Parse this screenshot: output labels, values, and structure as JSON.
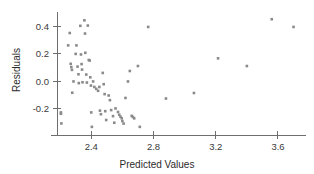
{
  "chart_data": {
    "type": "scatter",
    "title": "",
    "xlabel": "Predicted Values",
    "ylabel": "Residuals",
    "xlim": [
      2.18,
      3.78
    ],
    "ylim": [
      -0.36,
      0.49
    ],
    "xticks": [
      2.4,
      2.8,
      3.2,
      3.6
    ],
    "xticklabels": [
      "2.4",
      "2.8",
      "3.2",
      "3.6"
    ],
    "yticks": [
      -0.2,
      0.0,
      0.2,
      0.4
    ],
    "yticklabels": [
      "-0.2",
      "0.0",
      "0.2",
      "0.4"
    ],
    "grid": false,
    "legend": null,
    "marker": {
      "shape": "square",
      "color": "#8a8a8a",
      "size": 2.6
    },
    "series": [
      {
        "name": "residuals",
        "points": [
          [
            2.205,
            -0.225
          ],
          [
            2.205,
            -0.235
          ],
          [
            2.208,
            -0.305
          ],
          [
            2.252,
            0.262
          ],
          [
            2.262,
            0.352
          ],
          [
            2.268,
            0.128
          ],
          [
            2.272,
            0.104
          ],
          [
            2.276,
            0.084
          ],
          [
            2.278,
            -0.082
          ],
          [
            2.286,
            0.0
          ],
          [
            2.3,
            0.2
          ],
          [
            2.305,
            0.262
          ],
          [
            2.312,
            0.108
          ],
          [
            2.318,
            0.052
          ],
          [
            2.32,
            -0.012
          ],
          [
            2.33,
            0.404
          ],
          [
            2.334,
            0.196
          ],
          [
            2.338,
            0.126
          ],
          [
            2.341,
            0.086
          ],
          [
            2.344,
            -0.006
          ],
          [
            2.356,
            0.444
          ],
          [
            2.36,
            0.348
          ],
          [
            2.362,
            0.208
          ],
          [
            2.368,
            0.05
          ],
          [
            2.372,
            -0.008
          ],
          [
            2.378,
            0.406
          ],
          [
            2.384,
            0.156
          ],
          [
            2.39,
            0.152
          ],
          [
            2.394,
            0.03
          ],
          [
            2.398,
            -0.03
          ],
          [
            2.4,
            -0.225
          ],
          [
            2.404,
            -0.33
          ],
          [
            2.412,
            0.0
          ],
          [
            2.42,
            -0.04
          ],
          [
            2.432,
            -0.054
          ],
          [
            2.444,
            -0.068
          ],
          [
            2.452,
            -0.04
          ],
          [
            2.456,
            -0.212
          ],
          [
            2.462,
            -0.238
          ],
          [
            2.474,
            0.062
          ],
          [
            2.48,
            -0.02
          ],
          [
            2.486,
            -0.092
          ],
          [
            2.49,
            -0.216
          ],
          [
            2.496,
            -0.28
          ],
          [
            2.512,
            -0.102
          ],
          [
            2.52,
            -0.136
          ],
          [
            2.528,
            -0.208
          ],
          [
            2.54,
            -0.252
          ],
          [
            2.548,
            -0.3
          ],
          [
            2.556,
            -0.196
          ],
          [
            2.572,
            -0.222
          ],
          [
            2.58,
            -0.242
          ],
          [
            2.588,
            -0.256
          ],
          [
            2.596,
            -0.268
          ],
          [
            2.6,
            -0.288
          ],
          [
            2.608,
            -0.306
          ],
          [
            2.62,
            -0.12
          ],
          [
            2.636,
            0.0
          ],
          [
            2.648,
            0.076
          ],
          [
            2.66,
            -0.25
          ],
          [
            2.668,
            -0.258
          ],
          [
            2.676,
            -0.268
          ],
          [
            2.7,
            0.112
          ],
          [
            2.712,
            -0.33
          ],
          [
            2.766,
            0.396
          ],
          [
            2.88,
            -0.124
          ],
          [
            3.06,
            -0.084
          ],
          [
            3.215,
            0.168
          ],
          [
            3.4,
            0.112
          ],
          [
            3.56,
            0.452
          ],
          [
            3.7,
            0.396
          ]
        ]
      }
    ]
  }
}
